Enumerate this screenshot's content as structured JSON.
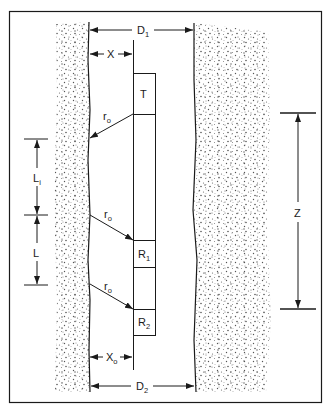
{
  "diagram": {
    "colors": {
      "line": "#1a1a1a",
      "stipple": "#555555",
      "background": "#ffffff"
    },
    "tool": {
      "transmitter": {
        "label": "T"
      },
      "receiver1": {
        "label": "R",
        "sub": "1"
      },
      "receiver2": {
        "label": "R",
        "sub": "2"
      }
    },
    "dimensions": {
      "d1": {
        "label": "D",
        "sub": "1"
      },
      "d2": {
        "label": "D",
        "sub": "2"
      },
      "x": {
        "label": "X"
      },
      "xo": {
        "label": "X",
        "sub": "o"
      },
      "li": {
        "label": "L",
        "sub": "i"
      },
      "l": {
        "label": "L"
      },
      "z": {
        "label": "Z"
      }
    },
    "rays": [
      {
        "label": "r",
        "sub": "o"
      },
      {
        "label": "r",
        "sub": "o"
      },
      {
        "label": "r",
        "sub": "o"
      }
    ]
  }
}
